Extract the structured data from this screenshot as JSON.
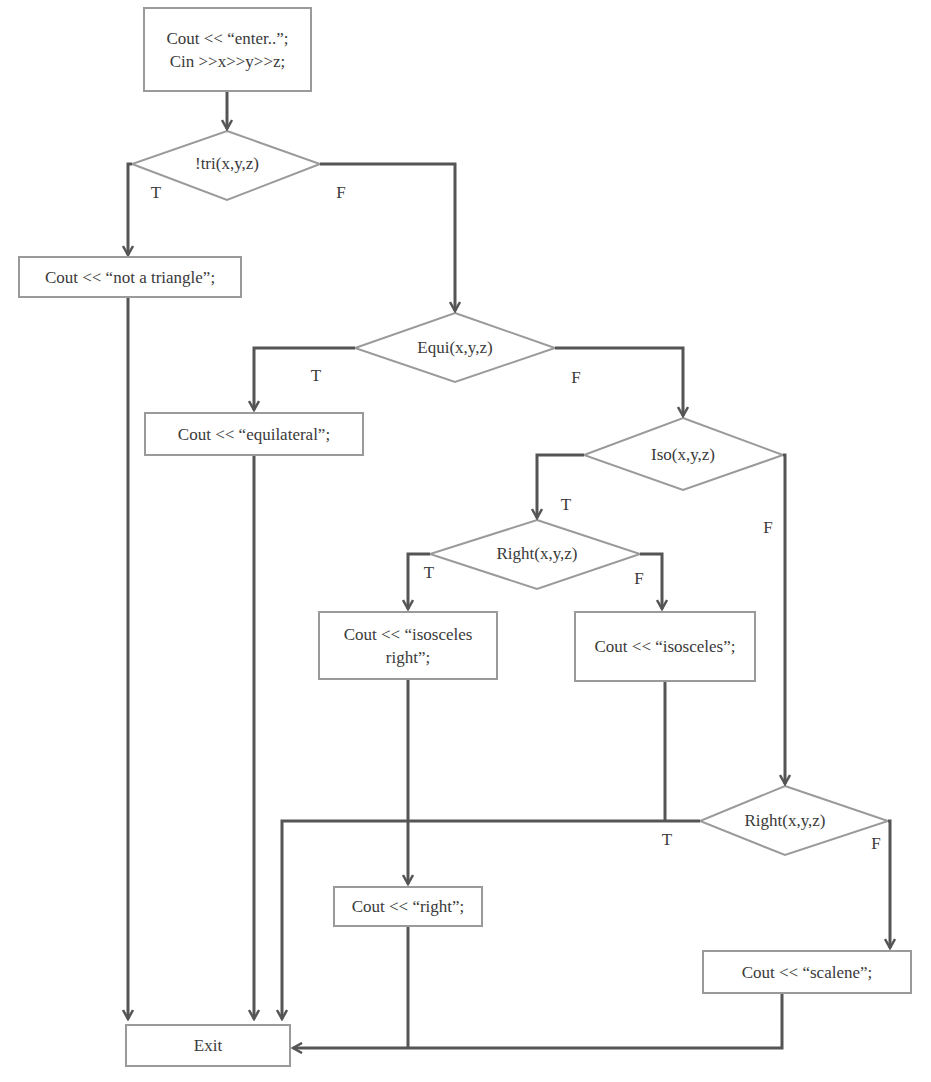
{
  "diagram": {
    "type": "flowchart",
    "colors": {
      "background": "#ffffff",
      "shape_border": "#9a9a9a",
      "connector": "#555555",
      "text": "#3a3a3a"
    },
    "nodes": {
      "input": {
        "line1": "Cout << “enter..”;",
        "line2": "Cin >>x>>y>>z;"
      },
      "not_tri": {
        "label": "!tri(x,y,z)"
      },
      "not_triangle_out": {
        "label": "Cout << “not a triangle”;"
      },
      "equi": {
        "label": "Equi(x,y,z)"
      },
      "equilateral_out": {
        "label": "Cout << “equilateral”;"
      },
      "iso": {
        "label": "Iso(x,y,z)"
      },
      "right_iso": {
        "label": "Right(x,y,z)"
      },
      "isosceles_right_out": {
        "line1": "Cout << “isosceles",
        "line2": "right”;"
      },
      "isosceles_out": {
        "label": "Cout << “isosceles”;"
      },
      "right_scalene": {
        "label": "Right(x,y,z)"
      },
      "right_out": {
        "label": "Cout << “right”;"
      },
      "scalene_out": {
        "label": "Cout << “scalene”;"
      },
      "exit": {
        "label": "Exit"
      }
    },
    "branch_labels": {
      "not_tri_true": "T",
      "not_tri_false": "F",
      "equi_true": "T",
      "equi_false": "F",
      "iso_true": "T",
      "iso_false": "F",
      "right_iso_true": "T",
      "right_iso_false": "F",
      "right_scalene_true": "T",
      "right_scalene_false": "F"
    },
    "edges": [
      {
        "from": "input",
        "to": "not_tri"
      },
      {
        "from": "not_tri",
        "to": "not_triangle_out",
        "label": "T"
      },
      {
        "from": "not_tri",
        "to": "equi",
        "label": "F"
      },
      {
        "from": "not_triangle_out",
        "to": "exit"
      },
      {
        "from": "equi",
        "to": "equilateral_out",
        "label": "T"
      },
      {
        "from": "equi",
        "to": "iso",
        "label": "F"
      },
      {
        "from": "equilateral_out",
        "to": "exit"
      },
      {
        "from": "iso",
        "to": "right_iso",
        "label": "T"
      },
      {
        "from": "iso",
        "to": "right_scalene",
        "label": "F"
      },
      {
        "from": "right_iso",
        "to": "isosceles_right_out",
        "label": "T"
      },
      {
        "from": "right_iso",
        "to": "isosceles_out",
        "label": "F"
      },
      {
        "from": "isosceles_right_out",
        "to": "right_out"
      },
      {
        "from": "isosceles_out",
        "to": "exit"
      },
      {
        "from": "right_scalene",
        "to": "exit",
        "label": "T"
      },
      {
        "from": "right_scalene",
        "to": "scalene_out",
        "label": "F"
      },
      {
        "from": "right_out",
        "to": "exit"
      },
      {
        "from": "scalene_out",
        "to": "exit"
      }
    ]
  }
}
